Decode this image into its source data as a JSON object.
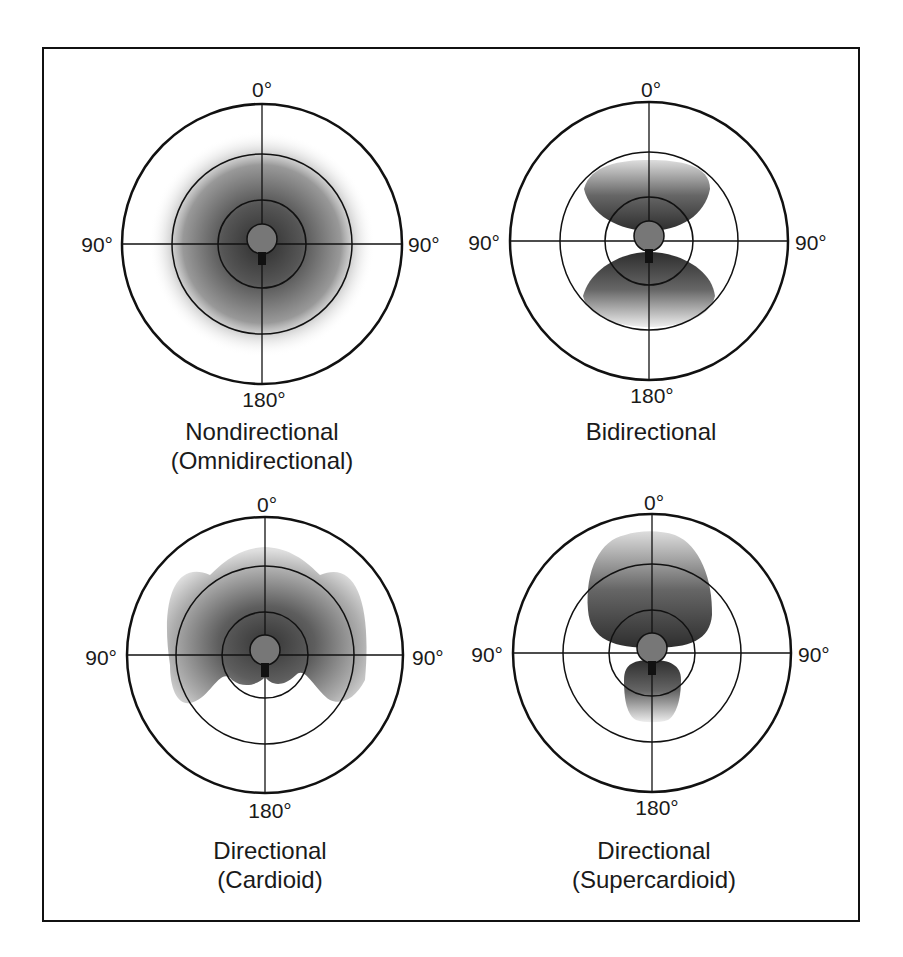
{
  "figure": {
    "angle_labels": {
      "top": "0°",
      "left": "90°",
      "right": "90°",
      "bottom": "180°"
    },
    "panels": [
      {
        "id": "omni",
        "caption_line1": "Nondirectional",
        "caption_line2": "(Omnidirectional)",
        "pattern": "omnidirectional"
      },
      {
        "id": "bi",
        "caption_line1": "Bidirectional",
        "caption_line2": "",
        "pattern": "figure-eight"
      },
      {
        "id": "cardioid",
        "caption_line1": "Directional",
        "caption_line2": "(Cardioid)",
        "pattern": "cardioid"
      },
      {
        "id": "supercardioid",
        "caption_line1": "Directional",
        "caption_line2": "(Supercardioid)",
        "pattern": "supercardioid"
      }
    ]
  },
  "colors": {
    "line": "#111111",
    "shade_dark": "#3a3a3a",
    "shade_light": "#ffffff",
    "mic": "#777777"
  }
}
